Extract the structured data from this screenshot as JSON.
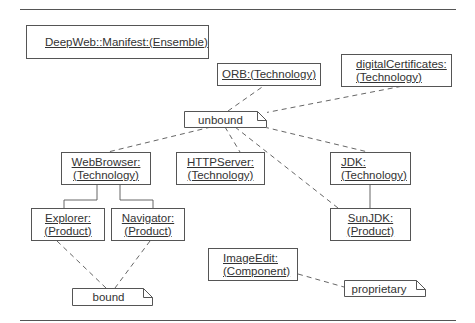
{
  "diagram": {
    "nodes": {
      "deepweb": {
        "line1": "DeepWeb::Manifest:(Ensemble)"
      },
      "orb": {
        "line1": "ORB:(Technology)"
      },
      "digital_certificates": {
        "line1": "digitalCertificates:",
        "line2": "(Technology)"
      },
      "webbrowser": {
        "line1": "WebBrowser:",
        "line2": "(Technology)"
      },
      "httpserver": {
        "line1": "HTTPServer:",
        "line2": "(Technology)"
      },
      "jdk": {
        "line1": "JDK:",
        "line2": "(Technology)"
      },
      "explorer": {
        "line1": "Explorer:",
        "line2": "(Product)"
      },
      "navigator": {
        "line1": "Navigator:",
        "line2": "(Product)"
      },
      "sunjdk": {
        "line1": "SunJDK:",
        "line2": "(Product)"
      },
      "imageedit": {
        "line1": "ImageEdit:",
        "line2": "(Component)"
      }
    },
    "notes": {
      "unbound": "unbound",
      "bound": "bound",
      "proprietary": "proprietary"
    },
    "edges": [
      {
        "from": "unbound",
        "to": "ORB",
        "style": "dashed"
      },
      {
        "from": "unbound",
        "to": "digitalCertificates",
        "style": "dashed"
      },
      {
        "from": "unbound",
        "to": "WebBrowser",
        "style": "dashed"
      },
      {
        "from": "unbound",
        "to": "HTTPServer",
        "style": "dashed"
      },
      {
        "from": "unbound",
        "to": "JDK",
        "style": "dashed"
      },
      {
        "from": "unbound",
        "to": "SunJDK",
        "style": "dashed"
      },
      {
        "from": "WebBrowser",
        "to": "Explorer",
        "style": "solid"
      },
      {
        "from": "WebBrowser",
        "to": "Navigator",
        "style": "solid"
      },
      {
        "from": "JDK",
        "to": "SunJDK",
        "style": "solid"
      },
      {
        "from": "bound",
        "to": "Explorer",
        "style": "dashed"
      },
      {
        "from": "bound",
        "to": "Navigator",
        "style": "dashed"
      },
      {
        "from": "proprietary",
        "to": "ImageEdit",
        "style": "dashed"
      }
    ]
  }
}
